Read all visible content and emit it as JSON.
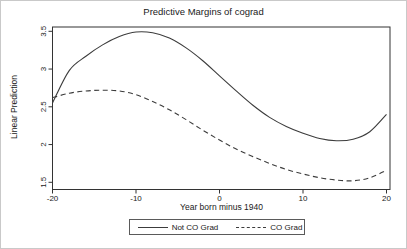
{
  "chart_data": {
    "type": "line",
    "title": "Predictive Margins of cograd",
    "xlabel": "Year born minus 1940",
    "ylabel": "Linear Prediction",
    "x_ticks": [
      -20,
      -10,
      0,
      10,
      20
    ],
    "y_ticks": [
      1.5,
      2,
      2.5,
      3,
      3.5
    ],
    "xlim": [
      -20,
      20
    ],
    "ylim": [
      1.5,
      3.5
    ],
    "grid": false,
    "legend_position": "bottom-center",
    "x": [
      -20,
      -18,
      -16,
      -14,
      -12,
      -10,
      -8,
      -6,
      -4,
      -2,
      0,
      2,
      4,
      6,
      8,
      10,
      12,
      14,
      16,
      18,
      20
    ],
    "series": [
      {
        "name": "Not CO Grad",
        "style": "solid",
        "color": "#3c3c3c",
        "values": [
          2.55,
          2.98,
          3.17,
          3.32,
          3.43,
          3.49,
          3.48,
          3.41,
          3.28,
          3.11,
          2.91,
          2.71,
          2.52,
          2.36,
          2.24,
          2.15,
          2.08,
          2.05,
          2.07,
          2.17,
          2.4
        ]
      },
      {
        "name": "CO Grad",
        "style": "dashed",
        "color": "#3c3c3c",
        "values": [
          2.62,
          2.68,
          2.71,
          2.72,
          2.71,
          2.66,
          2.57,
          2.46,
          2.33,
          2.19,
          2.06,
          1.94,
          1.84,
          1.75,
          1.67,
          1.61,
          1.56,
          1.53,
          1.52,
          1.56,
          1.66
        ]
      }
    ],
    "axis_color": "#333333",
    "tick_label_color": "#1a1a1a"
  }
}
